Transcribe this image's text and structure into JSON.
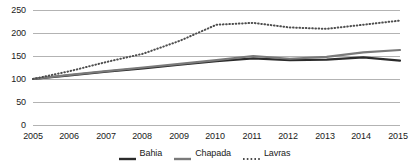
{
  "chart_data": {
    "type": "line",
    "title": "",
    "xlabel": "",
    "ylabel": "",
    "grid": true,
    "legend_position": "bottom",
    "ylim": [
      0,
      250
    ],
    "yticks": [
      0,
      50,
      100,
      150,
      200,
      250
    ],
    "categories": [
      "2005",
      "2006",
      "2007",
      "2008",
      "2009",
      "2010",
      "2011",
      "2012",
      "2013",
      "2014",
      "2015"
    ],
    "series": [
      {
        "name": "Bahia",
        "style": "solid",
        "color": "#2b2b2b",
        "values": [
          100,
          108,
          116,
          123,
          131,
          139,
          145,
          141,
          142,
          147,
          140
        ]
      },
      {
        "name": "Chapada",
        "style": "solid",
        "color": "#7a7a7a",
        "values": [
          100,
          109,
          117,
          125,
          133,
          141,
          150,
          144,
          148,
          158,
          163
        ]
      },
      {
        "name": "Lavras",
        "style": "dotted",
        "color": "#4d4d4d",
        "values": [
          100,
          117,
          137,
          155,
          183,
          218,
          222,
          212,
          209,
          218,
          227
        ]
      }
    ]
  },
  "axis": {
    "y_tick_labels": [
      "250",
      "200",
      "150",
      "100",
      "50",
      "0"
    ],
    "x_tick_labels": [
      "2005",
      "2006",
      "2007",
      "2008",
      "2009",
      "2010",
      "2011",
      "2012",
      "2013",
      "2014",
      "2015"
    ]
  },
  "legend": {
    "items": [
      {
        "label": "Bahia",
        "style": "solid",
        "color": "#2b2b2b"
      },
      {
        "label": "Chapada",
        "style": "solid",
        "color": "#7a7a7a"
      },
      {
        "label": "Lavras",
        "style": "dotted",
        "color": "#4d4d4d"
      }
    ]
  },
  "colors": {
    "background": "#ffffff",
    "gridline": "#b3b3b3",
    "axis_text": "#1a1a1a"
  }
}
